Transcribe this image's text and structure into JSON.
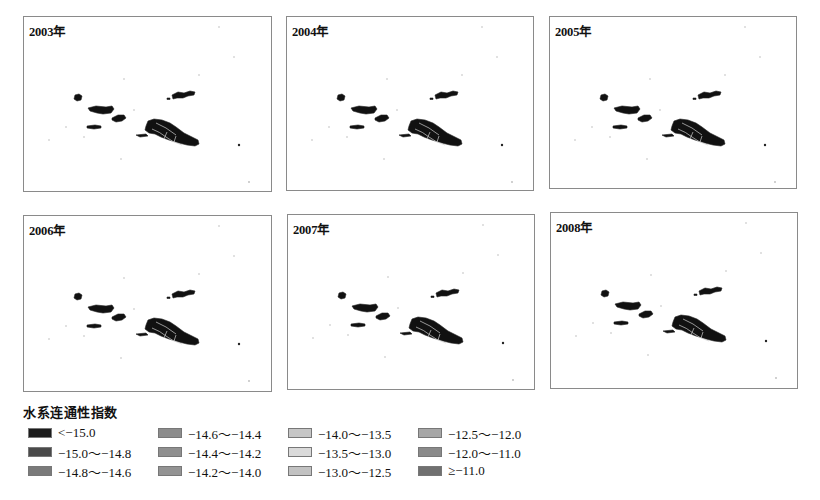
{
  "figure": {
    "panels": [
      {
        "year_label": "2003年",
        "x": 23,
        "y": 16,
        "w": 249,
        "h": 176
      },
      {
        "year_label": "2004年",
        "x": 286,
        "y": 16,
        "w": 248,
        "h": 175
      },
      {
        "year_label": "2005年",
        "x": 549,
        "y": 16,
        "w": 248,
        "h": 173
      },
      {
        "year_label": "2006年",
        "x": 23,
        "y": 215,
        "w": 249,
        "h": 177
      },
      {
        "year_label": "2007年",
        "x": 287,
        "y": 214,
        "w": 248,
        "h": 176
      },
      {
        "year_label": "2008年",
        "x": 550,
        "y": 212,
        "w": 248,
        "h": 177
      }
    ]
  },
  "legend": {
    "title": "水系连通性指数",
    "items": [
      {
        "label": "<−15.0",
        "color": "#1c1c1c"
      },
      {
        "label": "−15.0～−14.8",
        "color": "#4a4a4a"
      },
      {
        "label": "−14.8～−14.6",
        "color": "#7a7a7a"
      },
      {
        "label": "−14.6～−14.4",
        "color": "#8c8c8c"
      },
      {
        "label": "−14.4～−14.2",
        "color": "#8f8f8f"
      },
      {
        "label": "−14.2～−14.0",
        "color": "#939393"
      },
      {
        "label": "−14.0～−13.5",
        "color": "#c6c6c6"
      },
      {
        "label": "−13.5～−13.0",
        "color": "#dadada"
      },
      {
        "label": "−13.0～−12.5",
        "color": "#c2c2c2"
      },
      {
        "label": "−12.5～−12.0",
        "color": "#a6a6a6"
      },
      {
        "label": "−12.0～−11.0",
        "color": "#8a8a8a"
      },
      {
        "label": "≥−11.0",
        "color": "#707070"
      }
    ]
  }
}
